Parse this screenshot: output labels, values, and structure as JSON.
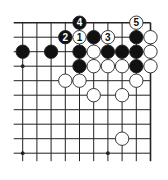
{
  "diagram": {
    "type": "go-board-fragment",
    "grid": {
      "cols": 10,
      "rows": 10,
      "origin_x": 22.7,
      "origin_y": 22.7,
      "spacing_x": 14.2,
      "spacing_y": 14.5,
      "edges": {
        "top": true,
        "right": true,
        "left": false,
        "bottom": false
      },
      "line_color": "#222222"
    },
    "star_points": [
      {
        "col": 0,
        "row": 3
      },
      {
        "col": 0,
        "row": 9
      },
      {
        "col": 6,
        "row": 9
      }
    ],
    "stones": [
      {
        "col": 4,
        "row": 0,
        "color": "black",
        "label": "4"
      },
      {
        "col": 8,
        "row": 0,
        "color": "white",
        "label": "5"
      },
      {
        "col": 3,
        "row": 1,
        "color": "black",
        "label": "2"
      },
      {
        "col": 4,
        "row": 1,
        "color": "white",
        "label": "1"
      },
      {
        "col": 5,
        "row": 1,
        "color": "black",
        "label": ""
      },
      {
        "col": 6,
        "row": 1,
        "color": "white",
        "label": "3"
      },
      {
        "col": 8,
        "row": 1,
        "color": "black",
        "label": ""
      },
      {
        "col": 9,
        "row": 1,
        "color": "white",
        "label": ""
      },
      {
        "col": 0,
        "row": 2,
        "color": "black",
        "label": ""
      },
      {
        "col": 2,
        "row": 2,
        "color": "black",
        "label": ""
      },
      {
        "col": 4,
        "row": 2,
        "color": "black",
        "label": ""
      },
      {
        "col": 5,
        "row": 2,
        "color": "white",
        "label": ""
      },
      {
        "col": 6,
        "row": 2,
        "color": "black",
        "label": ""
      },
      {
        "col": 7,
        "row": 2,
        "color": "black",
        "label": ""
      },
      {
        "col": 8,
        "row": 2,
        "color": "black",
        "label": ""
      },
      {
        "col": 9,
        "row": 2,
        "color": "white",
        "label": ""
      },
      {
        "col": 4,
        "row": 3,
        "color": "black",
        "label": ""
      },
      {
        "col": 5,
        "row": 3,
        "color": "white",
        "label": ""
      },
      {
        "col": 6,
        "row": 3,
        "color": "white",
        "label": ""
      },
      {
        "col": 7,
        "row": 3,
        "color": "white",
        "label": ""
      },
      {
        "col": 8,
        "row": 3,
        "color": "black",
        "label": ""
      },
      {
        "col": 9,
        "row": 3,
        "color": "white",
        "label": ""
      },
      {
        "col": 3,
        "row": 4,
        "color": "white",
        "label": ""
      },
      {
        "col": 4,
        "row": 4,
        "color": "white",
        "label": ""
      },
      {
        "col": 8,
        "row": 4,
        "color": "white",
        "label": ""
      },
      {
        "col": 5,
        "row": 5,
        "color": "white",
        "label": ""
      },
      {
        "col": 7,
        "row": 5,
        "color": "white",
        "label": ""
      },
      {
        "col": 7,
        "row": 8,
        "color": "white",
        "label": ""
      }
    ],
    "colors": {
      "black_stone": "#111111",
      "white_stone": "#ffffff",
      "stone_outline": "#222222"
    }
  }
}
